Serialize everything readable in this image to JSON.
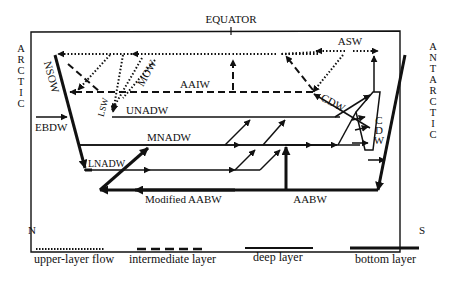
{
  "diagram": {
    "title_top": "EQUATOR",
    "left_side_label": [
      "A",
      "R",
      "C",
      "T",
      "I",
      "C"
    ],
    "right_side_label": [
      "A",
      "N",
      "T",
      "A",
      "R",
      "C",
      "T",
      "I",
      "C"
    ],
    "bottom_left": "N",
    "bottom_right": "S",
    "water_masses": {
      "nsow": "NSOW",
      "ebdw": "EBDW",
      "lsw": "LSW",
      "mow": "MOW",
      "aaiw": "AAIW",
      "unadw": "UNADW",
      "mnadw": "MNADW",
      "lnadw": "LNADW",
      "modified_aabw": "Modified AABW",
      "aabw": "AABW",
      "cdw_upper": "CDW",
      "cdw_vertical": [
        "C",
        "D",
        "W"
      ],
      "asw": "ASW"
    },
    "legend": [
      {
        "style": "dotted",
        "label": "upper-layer flow"
      },
      {
        "style": "dashed",
        "label": "intermediate layer"
      },
      {
        "style": "solid",
        "label": "deep layer"
      },
      {
        "style": "thick",
        "label": "bottom layer"
      }
    ],
    "colors": {
      "ink": "#111111",
      "background": "#ffffff"
    }
  }
}
